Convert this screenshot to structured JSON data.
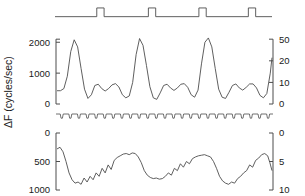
{
  "figure": {
    "background_color": "#ffffff",
    "line_color": "#4d4d4d",
    "axis_color": "#4d4d4d",
    "text_color": "#1a1a1a",
    "width": 305,
    "height": 196,
    "shared_ylabel": "ΔF (cycles/sec)"
  },
  "axes_labels": {
    "top_left": [
      "2000",
      "1000",
      "0"
    ],
    "top_right": [
      "50",
      "20",
      "10",
      "0"
    ],
    "bottom_left": [
      "0",
      "500",
      "1000"
    ],
    "bottom_right": [
      "0",
      "5",
      "10"
    ]
  },
  "chart_data": [
    {
      "type": "line",
      "name": "stimulus-marker",
      "title": "",
      "xlabel": "",
      "ylabel": "",
      "grid": false,
      "legend": "none",
      "xlim": [
        0,
        100
      ],
      "ylim": [
        0,
        1
      ],
      "description": "Square-pulse stimulus marker trace: flat baseline with four brief upward pulses",
      "pulse_count": 4,
      "pulse_onsets": [
        18.5,
        42.5,
        66.0,
        89.0
      ],
      "pulse_width": 3.4,
      "baseline": 0.18,
      "pulse_level": 0.85,
      "x": [
        0,
        18.5,
        18.5,
        21.9,
        21.9,
        42.5,
        42.5,
        45.9,
        45.9,
        66.0,
        66.0,
        69.4,
        69.4,
        89.0,
        89.0,
        92.4,
        92.4,
        100
      ],
      "y": [
        0.18,
        0.18,
        0.85,
        0.85,
        0.18,
        0.18,
        0.85,
        0.85,
        0.18,
        0.18,
        0.85,
        0.85,
        0.18,
        0.18,
        0.85,
        0.85,
        0.18,
        0.18
      ]
    },
    {
      "type": "line",
      "name": "delta-f-upper-trace",
      "title": "",
      "xlabel": "",
      "ylabel": "ΔF (cycles/sec)",
      "grid": false,
      "legend": "none",
      "xlim": [
        0,
        100
      ],
      "ylim": [
        0,
        2300
      ],
      "yticks_left": [
        0,
        1000,
        2000
      ],
      "ylim_right": [
        0,
        25
      ],
      "yticks_right": [
        0,
        10,
        20,
        50
      ],
      "description": "Oscillating delta-F trace: six tall sharp peaks near 2100 alternating with lower broad bumps near 600-700, troughs near 100-250",
      "x": [
        0.0,
        1.6,
        3.2,
        4.8,
        6.4,
        8.0,
        9.6,
        11.2,
        12.8,
        14.4,
        16.0,
        17.6,
        19.2,
        20.8,
        22.4,
        24.0,
        25.6,
        27.2,
        28.8,
        30.4,
        32.0,
        33.6,
        35.2,
        36.8,
        38.4,
        40.0,
        41.6,
        43.2,
        44.8,
        46.4,
        48.0,
        49.6,
        51.2,
        52.8,
        54.4,
        56.0,
        57.6,
        59.2,
        60.8,
        62.4,
        64.0,
        65.6,
        67.2,
        68.8,
        70.4,
        72.0,
        73.6,
        75.2,
        76.8,
        78.4,
        80.0,
        81.6,
        83.2,
        84.8,
        86.4,
        88.0,
        89.6,
        91.2,
        92.8,
        94.4,
        96.0,
        97.6,
        99.2,
        100.0
      ],
      "y": [
        430,
        430,
        500,
        900,
        1700,
        2080,
        1850,
        1150,
        480,
        180,
        300,
        600,
        640,
        500,
        420,
        500,
        620,
        660,
        550,
        300,
        200,
        260,
        700,
        1600,
        2120,
        1900,
        1250,
        560,
        200,
        150,
        360,
        600,
        640,
        520,
        440,
        520,
        640,
        660,
        540,
        300,
        220,
        450,
        1300,
        2000,
        2140,
        1850,
        1150,
        480,
        220,
        180,
        380,
        600,
        650,
        520,
        450,
        540,
        650,
        650,
        520,
        280,
        200,
        340,
        1000,
        1500
      ]
    },
    {
      "type": "line",
      "name": "sync-tick-trace",
      "title": "",
      "xlabel": "",
      "ylabel": "",
      "grid": false,
      "legend": "none",
      "xlim": [
        0,
        100
      ],
      "ylim": [
        0,
        1
      ],
      "description": "Thin flat trace with a regular train of small downward ticks (event/sync markers)",
      "tick_count": 25,
      "baseline": 0.25,
      "tick_depth": 0.6
    },
    {
      "type": "line",
      "name": "delta-f-lower-trace",
      "title": "",
      "xlabel": "",
      "ylabel": "ΔF (cycles/sec)",
      "grid": false,
      "legend": "none",
      "xlim": [
        0,
        100
      ],
      "ylim": [
        1100,
        -50
      ],
      "y_inverted": true,
      "yticks_left": [
        0,
        500,
        1000
      ],
      "ylim_right": [
        10,
        0
      ],
      "yticks_right": [
        0,
        5,
        10
      ],
      "description": "Inverted-axis delta-F trace: starts near 280, descends to ~900, then three broad elevations toward ~350-400 separated by noisy dips near 800-900",
      "x": [
        0.0,
        1.4,
        2.8,
        4.2,
        5.6,
        7.0,
        8.4,
        9.8,
        11.2,
        12.6,
        14.0,
        15.4,
        16.8,
        18.2,
        19.6,
        21.0,
        22.4,
        23.8,
        25.2,
        26.6,
        28.0,
        29.4,
        30.8,
        32.2,
        33.6,
        35.0,
        36.4,
        37.8,
        39.2,
        40.6,
        42.0,
        43.4,
        44.8,
        46.2,
        47.6,
        49.0,
        50.4,
        51.8,
        53.2,
        54.6,
        56.0,
        57.4,
        58.8,
        60.2,
        61.6,
        63.0,
        64.4,
        65.8,
        67.2,
        68.6,
        70.0,
        71.4,
        72.8,
        74.2,
        75.6,
        77.0,
        78.4,
        79.8,
        81.2,
        82.6,
        84.0,
        85.4,
        86.8,
        88.2,
        89.6,
        91.0,
        92.4,
        93.8,
        95.2,
        96.6,
        98.0,
        99.0,
        100.0
      ],
      "y": [
        280,
        250,
        330,
        500,
        700,
        820,
        880,
        860,
        900,
        790,
        860,
        760,
        820,
        700,
        760,
        620,
        700,
        560,
        640,
        480,
        430,
        400,
        370,
        360,
        380,
        350,
        360,
        420,
        520,
        660,
        740,
        780,
        800,
        790,
        810,
        800,
        760,
        700,
        740,
        620,
        660,
        540,
        600,
        500,
        540,
        450,
        420,
        400,
        390,
        380,
        400,
        420,
        500,
        620,
        760,
        840,
        880,
        900,
        860,
        880,
        800,
        760,
        700,
        660,
        560,
        600,
        480,
        440,
        380,
        360,
        400,
        520,
        660
      ]
    }
  ]
}
